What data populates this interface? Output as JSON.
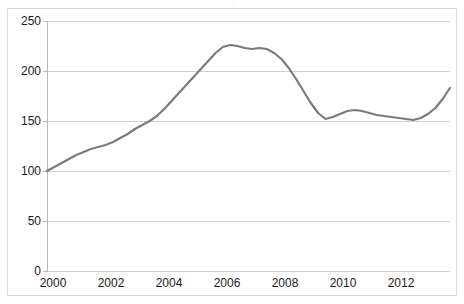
{
  "chart_data": {
    "type": "line",
    "title": "",
    "title_remnant": "·",
    "xlabel": "",
    "ylabel": "",
    "xlim": [
      2000,
      2013.75
    ],
    "ylim": [
      0,
      250
    ],
    "grid": true,
    "legend": false,
    "y_ticks": [
      0,
      50,
      100,
      150,
      200,
      250
    ],
    "x_ticks": [
      2000,
      2002,
      2004,
      2006,
      2008,
      2010,
      2012
    ],
    "x_tick_labels": [
      "2000",
      "2002",
      "2004",
      "2006",
      "2008",
      "2010",
      "2012"
    ],
    "y_tick_labels": [
      "0",
      "50",
      "100",
      "150",
      "200",
      "250"
    ],
    "series": [
      {
        "name": "Index",
        "color": "#7b7b7b",
        "x": [
          2000.0,
          2000.25,
          2000.5,
          2000.75,
          2001.0,
          2001.25,
          2001.5,
          2001.75,
          2002.0,
          2002.25,
          2002.5,
          2002.75,
          2003.0,
          2003.25,
          2003.5,
          2003.75,
          2004.0,
          2004.25,
          2004.5,
          2004.75,
          2005.0,
          2005.25,
          2005.5,
          2005.75,
          2006.0,
          2006.25,
          2006.5,
          2006.75,
          2007.0,
          2007.25,
          2007.5,
          2007.75,
          2008.0,
          2008.25,
          2008.5,
          2008.75,
          2009.0,
          2009.25,
          2009.5,
          2009.75,
          2010.0,
          2010.25,
          2010.5,
          2010.75,
          2011.0,
          2011.25,
          2011.5,
          2011.75,
          2012.0,
          2012.25,
          2012.5,
          2012.75,
          2013.0,
          2013.25,
          2013.5,
          2013.75
        ],
        "values": [
          100,
          104,
          108,
          112,
          116,
          119,
          122,
          124,
          126,
          129,
          133,
          137,
          142,
          146,
          150,
          155,
          162,
          170,
          178,
          186,
          194,
          202,
          210,
          218,
          224,
          226,
          225,
          223,
          222,
          223,
          222,
          218,
          212,
          203,
          192,
          180,
          168,
          158,
          152,
          154,
          157,
          160,
          161,
          160,
          158,
          156,
          155,
          154,
          153,
          152,
          151,
          153,
          157,
          163,
          172,
          183
        ]
      }
    ]
  },
  "axes": {
    "y_axis_name": "value-axis",
    "x_axis_name": "year-axis"
  }
}
